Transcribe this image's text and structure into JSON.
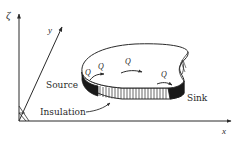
{
  "figure": {
    "axes": {
      "zeta_label": "ζ",
      "y_label": "y",
      "x_label": "x"
    },
    "flow_labels": [
      "Q",
      "Q",
      "Q",
      "Q"
    ],
    "callouts": {
      "source": "Source",
      "insulation": "Insulation",
      "sink": "Sink"
    },
    "colors": {
      "ink": "#2a2a2a",
      "background": "#ffffff"
    }
  }
}
